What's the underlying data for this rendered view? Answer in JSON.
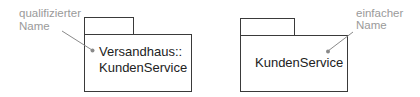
{
  "diagram": {
    "left_package": {
      "name_lines": [
        "Versandhaus::",
        "KundenService"
      ],
      "annotation_lines": [
        "qualifizierter",
        "Name"
      ]
    },
    "right_package": {
      "name_lines": [
        "KundenService"
      ],
      "annotation_lines": [
        "einfacher",
        "Name"
      ]
    },
    "colors": {
      "outline": "#3a3a3a",
      "annotation": "#9a9a9a",
      "text": "#222222"
    }
  }
}
